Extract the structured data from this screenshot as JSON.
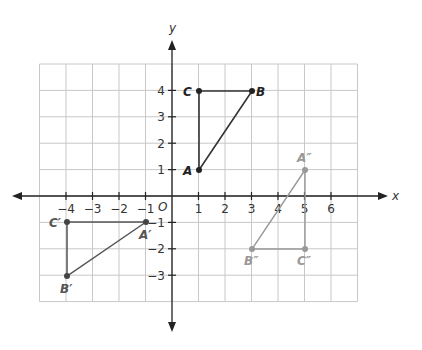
{
  "chart_data": {
    "type": "coordinate-plane",
    "title": "",
    "xlabel": "x",
    "ylabel": "y",
    "origin_label": "O",
    "grid": true,
    "xlim": [
      -5,
      7
    ],
    "ylim": [
      -4,
      5
    ],
    "x_ticks": [
      -4,
      -3,
      -2,
      -1,
      1,
      2,
      3,
      4,
      5,
      6
    ],
    "y_ticks": [
      4,
      3,
      2,
      1,
      -1,
      -2,
      -3
    ],
    "x_tick_labels": [
      "−4",
      "−3",
      "−2",
      "−1",
      "1",
      "2",
      "3",
      "4",
      "5",
      "6"
    ],
    "y_tick_labels": [
      "4",
      "3",
      "2",
      "1",
      "−1",
      "−2",
      "−3"
    ],
    "triangles": [
      {
        "name": "ABC",
        "color": "#333333",
        "points": [
          {
            "label": "A",
            "x": 1,
            "y": 1
          },
          {
            "label": "B",
            "x": 3,
            "y": 4
          },
          {
            "label": "C",
            "x": 1,
            "y": 4
          }
        ]
      },
      {
        "name": "A'B'C'",
        "color": "#555555",
        "points": [
          {
            "label": "A′",
            "x": -1,
            "y": -1
          },
          {
            "label": "B′",
            "x": -4,
            "y": -3
          },
          {
            "label": "C′",
            "x": -4,
            "y": -1
          }
        ]
      },
      {
        "name": "A''B''C''",
        "color": "#999999",
        "points": [
          {
            "label": "A″",
            "x": 5,
            "y": 1
          },
          {
            "label": "B″",
            "x": 3,
            "y": -2
          },
          {
            "label": "C″",
            "x": 5,
            "y": -2
          }
        ]
      }
    ]
  },
  "labels": {
    "x_axis": "x",
    "y_axis": "y",
    "origin": "O",
    "A": "A",
    "B": "B",
    "C": "C",
    "A1": "A′",
    "B1": "B′",
    "C1": "C′",
    "A2": "A″",
    "B2": "B″",
    "C2": "C″"
  }
}
